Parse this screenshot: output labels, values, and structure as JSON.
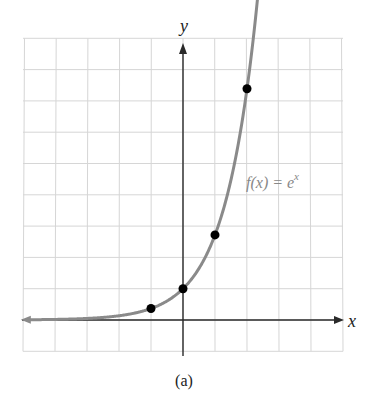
{
  "chart_data": {
    "type": "line",
    "title": "",
    "function_label": "f(x) = e^x",
    "function_label_base": "f(x) = e",
    "function_label_exp": "x",
    "xlabel": "x",
    "ylabel": "y",
    "caption": "(a)",
    "grid": true,
    "xlim": [
      -5,
      5
    ],
    "ylim": [
      -1,
      9
    ],
    "series": [
      {
        "name": "f(x) = e^x",
        "points": [
          {
            "x": -1,
            "y": 0.368
          },
          {
            "x": 0,
            "y": 1
          },
          {
            "x": 1,
            "y": 2.718
          },
          {
            "x": 2,
            "y": 7.389
          }
        ]
      }
    ],
    "colors": {
      "curve": "#8a8a8a",
      "axes": "#2a2a2a",
      "grid": "#d6d6d6",
      "points": "#000000"
    }
  }
}
